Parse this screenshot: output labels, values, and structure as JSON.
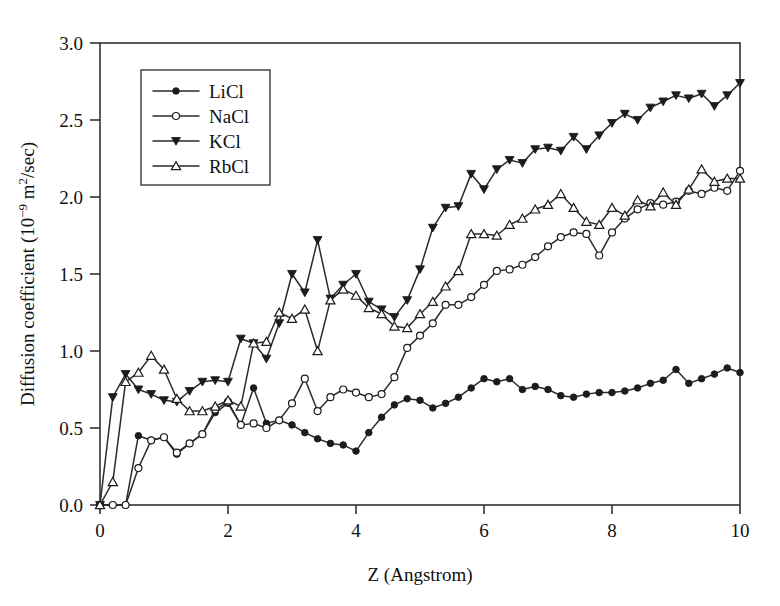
{
  "figure": {
    "background": "#ffffff",
    "ink_color": "#1c1c1c"
  },
  "chart_data": {
    "type": "line",
    "title": "",
    "subtitle": "",
    "xlabel": "Z (Angstrom)",
    "ylabel": "Diffusion coefficient (10−9 m²/sec)",
    "ylabel_parts": {
      "lead": "Diffusion coefficient (10",
      "exp": "−9",
      "mid": " m",
      "exp2": "2",
      "tail": "/sec)"
    },
    "xlim": [
      0,
      10
    ],
    "ylim": [
      0,
      3.0
    ],
    "xticks": [
      0,
      2,
      4,
      6,
      8,
      10
    ],
    "xtick_labels": [
      "0",
      "2",
      "4",
      "6",
      "8",
      "10"
    ],
    "yticks": [
      0.0,
      0.5,
      1.0,
      1.5,
      2.0,
      2.5,
      3.0
    ],
    "ytick_labels": [
      "0.0",
      "0.5",
      "1.0",
      "1.5",
      "2.0",
      "2.5",
      "3.0"
    ],
    "grid": false,
    "legend_position": "upper-left-inside",
    "legend_entries": [
      "LiCl",
      "NaCl",
      "KCl",
      "RbCl"
    ],
    "series": [
      {
        "name": "LiCl",
        "marker": "filled-circle",
        "color": "#1c1c1c",
        "x": [
          0.0,
          0.2,
          0.4,
          0.6,
          0.8,
          1.0,
          1.2,
          1.4,
          1.6,
          1.8,
          2.0,
          2.2,
          2.4,
          2.6,
          2.8,
          3.0,
          3.2,
          3.4,
          3.6,
          3.8,
          4.0,
          4.2,
          4.4,
          4.6,
          4.8,
          5.0,
          5.2,
          5.4,
          5.6,
          5.8,
          6.0,
          6.2,
          6.4,
          6.6,
          6.8,
          7.0,
          7.2,
          7.4,
          7.6,
          7.8,
          8.0,
          8.2,
          8.4,
          8.6,
          8.8,
          9.0,
          9.2,
          9.4,
          9.6,
          9.8,
          10.0
        ],
        "y": [
          0.0,
          0.0,
          0.0,
          0.45,
          0.42,
          0.44,
          0.33,
          0.4,
          0.46,
          0.6,
          0.66,
          0.52,
          0.76,
          0.53,
          0.55,
          0.52,
          0.47,
          0.43,
          0.4,
          0.39,
          0.35,
          0.47,
          0.57,
          0.65,
          0.69,
          0.68,
          0.63,
          0.66,
          0.7,
          0.76,
          0.82,
          0.8,
          0.82,
          0.75,
          0.77,
          0.75,
          0.71,
          0.7,
          0.72,
          0.73,
          0.73,
          0.74,
          0.76,
          0.79,
          0.81,
          0.88,
          0.79,
          0.82,
          0.85,
          0.89,
          0.86
        ]
      },
      {
        "name": "NaCl",
        "marker": "open-circle",
        "color": "#1c1c1c",
        "x": [
          0.0,
          0.2,
          0.4,
          0.6,
          0.8,
          1.0,
          1.2,
          1.4,
          1.6,
          1.8,
          2.0,
          2.2,
          2.4,
          2.6,
          2.8,
          3.0,
          3.2,
          3.4,
          3.6,
          3.8,
          4.0,
          4.2,
          4.4,
          4.6,
          4.8,
          5.0,
          5.2,
          5.4,
          5.6,
          5.8,
          6.0,
          6.2,
          6.4,
          6.6,
          6.8,
          7.0,
          7.2,
          7.4,
          7.6,
          7.8,
          8.0,
          8.2,
          8.4,
          8.6,
          8.8,
          9.0,
          9.2,
          9.4,
          9.6,
          9.8,
          10.0
        ],
        "y": [
          0.0,
          0.0,
          0.0,
          0.24,
          0.42,
          0.44,
          0.34,
          0.4,
          0.46,
          0.62,
          0.67,
          0.52,
          0.53,
          0.5,
          0.55,
          0.66,
          0.82,
          0.61,
          0.7,
          0.75,
          0.73,
          0.7,
          0.72,
          0.83,
          1.02,
          1.1,
          1.18,
          1.3,
          1.3,
          1.35,
          1.43,
          1.52,
          1.53,
          1.56,
          1.61,
          1.68,
          1.74,
          1.77,
          1.76,
          1.62,
          1.77,
          1.86,
          1.92,
          1.96,
          1.95,
          1.97,
          2.04,
          2.02,
          2.06,
          2.04,
          2.17
        ]
      },
      {
        "name": "KCl",
        "marker": "filled-triangle-down",
        "color": "#1c1c1c",
        "x": [
          0.0,
          0.2,
          0.4,
          0.6,
          0.8,
          1.0,
          1.2,
          1.4,
          1.6,
          1.8,
          2.0,
          2.2,
          2.4,
          2.6,
          2.8,
          3.0,
          3.2,
          3.4,
          3.6,
          3.8,
          4.0,
          4.2,
          4.4,
          4.6,
          4.8,
          5.0,
          5.2,
          5.4,
          5.6,
          5.8,
          6.0,
          6.2,
          6.4,
          6.6,
          6.8,
          7.0,
          7.2,
          7.4,
          7.6,
          7.8,
          8.0,
          8.2,
          8.4,
          8.6,
          8.8,
          9.0,
          9.2,
          9.4,
          9.6,
          9.8,
          10.0
        ],
        "y": [
          0.0,
          0.7,
          0.85,
          0.75,
          0.72,
          0.68,
          0.67,
          0.74,
          0.8,
          0.81,
          0.8,
          1.08,
          1.05,
          0.95,
          1.18,
          1.5,
          1.38,
          1.72,
          1.34,
          1.43,
          1.5,
          1.32,
          1.27,
          1.22,
          1.33,
          1.53,
          1.8,
          1.93,
          1.94,
          2.15,
          2.05,
          2.18,
          2.24,
          2.22,
          2.31,
          2.32,
          2.3,
          2.39,
          2.31,
          2.4,
          2.48,
          2.54,
          2.5,
          2.58,
          2.62,
          2.66,
          2.64,
          2.67,
          2.59,
          2.66,
          2.74
        ]
      },
      {
        "name": "RbCl",
        "marker": "open-triangle-up",
        "color": "#1c1c1c",
        "x": [
          0.0,
          0.2,
          0.4,
          0.6,
          0.8,
          1.0,
          1.2,
          1.4,
          1.6,
          1.8,
          2.0,
          2.2,
          2.4,
          2.6,
          2.8,
          3.0,
          3.2,
          3.4,
          3.6,
          3.8,
          4.0,
          4.2,
          4.4,
          4.6,
          4.8,
          5.0,
          5.2,
          5.4,
          5.6,
          5.8,
          6.0,
          6.2,
          6.4,
          6.6,
          6.8,
          7.0,
          7.2,
          7.4,
          7.6,
          7.8,
          8.0,
          8.2,
          8.4,
          8.6,
          8.8,
          9.0,
          9.2,
          9.4,
          9.6,
          9.8,
          10.0
        ],
        "y": [
          0.0,
          0.15,
          0.8,
          0.86,
          0.97,
          0.88,
          0.69,
          0.61,
          0.61,
          0.64,
          0.68,
          0.64,
          1.05,
          1.06,
          1.25,
          1.21,
          1.27,
          1.0,
          1.33,
          1.4,
          1.36,
          1.28,
          1.24,
          1.16,
          1.15,
          1.24,
          1.32,
          1.42,
          1.52,
          1.76,
          1.76,
          1.75,
          1.82,
          1.86,
          1.92,
          1.95,
          2.02,
          1.93,
          1.84,
          1.82,
          1.93,
          1.88,
          1.98,
          1.94,
          2.03,
          1.95,
          2.05,
          2.18,
          2.1,
          2.12,
          2.12
        ]
      }
    ]
  },
  "axes_geometry": {
    "plot_left_px": 100,
    "plot_right_px": 740,
    "plot_top_px": 43,
    "plot_bottom_px": 505
  },
  "legend": {
    "box_left_px": 141,
    "box_top_px": 70,
    "box_width_px": 129,
    "box_height_px": 115
  }
}
